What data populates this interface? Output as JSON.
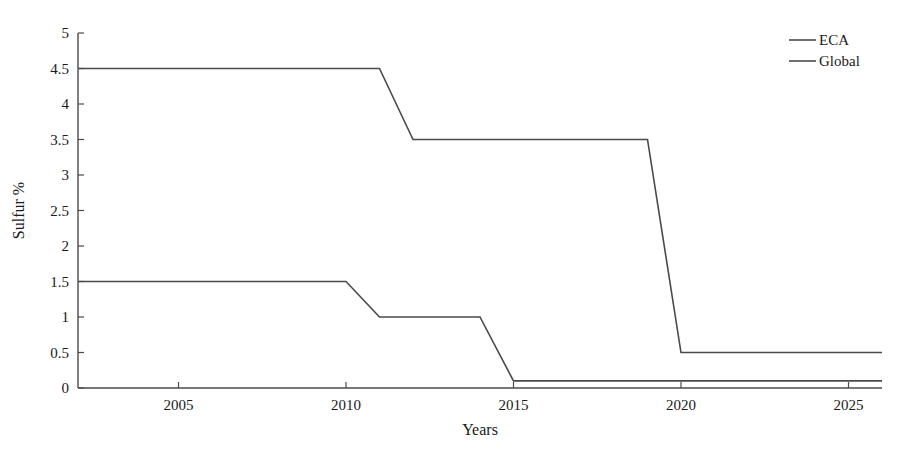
{
  "chart_data": {
    "type": "line",
    "title": "",
    "xlabel": "Years",
    "ylabel": "Sulfur %",
    "xlim": [
      2002,
      2026
    ],
    "ylim": [
      0,
      5
    ],
    "grid": false,
    "legend_position": "top-right",
    "xticks": [
      2005,
      2010,
      2015,
      2020,
      2025
    ],
    "xtick_labels": [
      "2005",
      "2010",
      "2015",
      "2020",
      "2025"
    ],
    "yticks": [
      0,
      0.5,
      1,
      1.5,
      2,
      2.5,
      3,
      3.5,
      4,
      4.5,
      5
    ],
    "ytick_labels": [
      "0",
      "0.5",
      "1",
      "1.5",
      "2",
      "2.5",
      "3",
      "3.5",
      "4",
      "4.5",
      "5"
    ],
    "series": [
      {
        "name": "ECA",
        "color": "#4a4a4a",
        "x": [
          2002,
          2010,
          2011,
          2014,
          2015,
          2026
        ],
        "values": [
          1.5,
          1.5,
          1.0,
          1.0,
          0.1,
          0.1
        ]
      },
      {
        "name": "Global",
        "color": "#4a4a4a",
        "x": [
          2002,
          2011,
          2012,
          2019,
          2020,
          2026
        ],
        "values": [
          4.5,
          4.5,
          3.5,
          3.5,
          0.5,
          0.5
        ]
      }
    ]
  },
  "legend": {
    "entries": [
      {
        "label": "ECA"
      },
      {
        "label": "Global"
      }
    ]
  },
  "axes": {
    "x_title": "Years",
    "y_title": "Sulfur %"
  }
}
